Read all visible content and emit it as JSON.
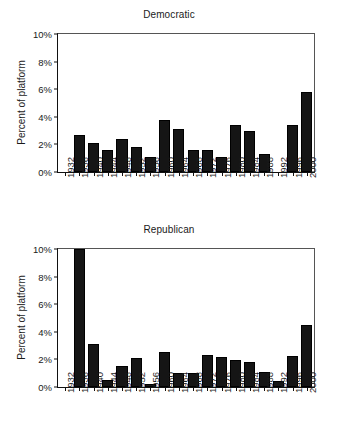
{
  "figure": {
    "background": "#ffffff",
    "bar_color": "#151515"
  },
  "chart_data": [
    {
      "type": "bar",
      "title": "Democratic",
      "xlabel": "",
      "ylabel": "Percent of platform",
      "ylim": [
        0,
        10
      ],
      "ytick_labels": [
        "0%",
        "2%",
        "4%",
        "6%",
        "8%",
        "10%"
      ],
      "ytick_values": [
        0,
        2,
        4,
        6,
        8,
        10
      ],
      "grid": false,
      "legend": "none",
      "categories": [
        "1932",
        "1936",
        "1940",
        "1944",
        "1948",
        "1952",
        "1956",
        "1960",
        "1964",
        "1968",
        "1972",
        "1976",
        "1980",
        "1984",
        "1988",
        "1992",
        "1996",
        "2000"
      ],
      "values": [
        0,
        2.7,
        2.1,
        1.6,
        2.4,
        1.8,
        1.1,
        3.8,
        3.1,
        1.6,
        1.6,
        1.1,
        3.4,
        3.0,
        1.3,
        0,
        3.4,
        5.8
      ]
    },
    {
      "type": "bar",
      "title": "Republican",
      "xlabel": "",
      "ylabel": "Percent of platform",
      "ylim": [
        0,
        10
      ],
      "ytick_labels": [
        "0%",
        "2%",
        "4%",
        "6%",
        "8%",
        "10%"
      ],
      "ytick_values": [
        0,
        2,
        4,
        6,
        8,
        10
      ],
      "grid": false,
      "legend": "none",
      "categories": [
        "1932",
        "1936",
        "1940",
        "1944",
        "1948",
        "1952",
        "1956",
        "1960",
        "1964",
        "1968",
        "1972",
        "1976",
        "1980",
        "1984",
        "1988",
        "1992",
        "1996",
        "2000"
      ],
      "values": [
        0,
        10.0,
        3.1,
        0.5,
        1.5,
        2.1,
        0.2,
        2.55,
        1.05,
        1.05,
        2.35,
        2.15,
        1.95,
        1.8,
        1.1,
        0.4,
        2.25,
        4.5
      ]
    }
  ]
}
